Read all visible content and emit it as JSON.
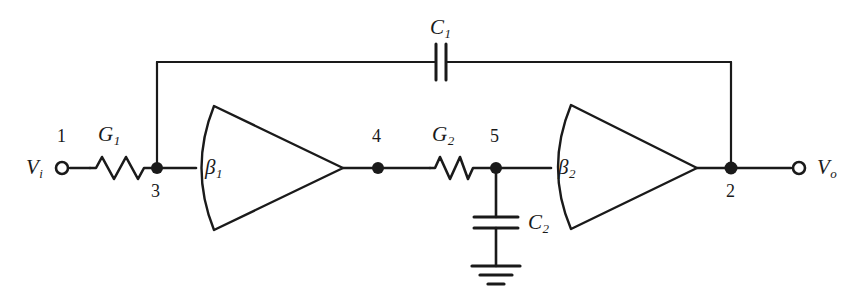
{
  "diagram": {
    "type": "circuit-schematic",
    "stroke_color": "#1a1a1a",
    "background_color": "#ffffff"
  },
  "terminals": [
    {
      "id": "vi",
      "label": "V",
      "sub": "i",
      "node_number": "1",
      "x": 62,
      "y": 168
    },
    {
      "id": "vo",
      "label": "V",
      "sub": "o",
      "node_number": "",
      "x": 799,
      "y": 168
    }
  ],
  "labels": {
    "input_voltage": "V",
    "input_voltage_sub": "i",
    "output_voltage": "V",
    "output_voltage_sub": "o",
    "resistor1": "G",
    "resistor1_sub": "1",
    "resistor2": "G",
    "resistor2_sub": "2",
    "capacitor1": "C",
    "capacitor1_sub": "1",
    "capacitor2": "C",
    "capacitor2_sub": "2",
    "amplifier1": "β",
    "amplifier1_sub": "1",
    "amplifier2": "β",
    "amplifier2_sub": "2"
  },
  "nodes": [
    {
      "number": "1",
      "x": 62,
      "y": 168,
      "kind": "terminal"
    },
    {
      "number": "3",
      "x": 157,
      "y": 168,
      "kind": "junction"
    },
    {
      "number": "4",
      "x": 378,
      "y": 168,
      "kind": "junction"
    },
    {
      "number": "5",
      "x": 496,
      "y": 168,
      "kind": "junction"
    },
    {
      "number": "2",
      "x": 731,
      "y": 168,
      "kind": "junction"
    }
  ],
  "components": [
    {
      "id": "G1",
      "type": "resistor",
      "label": "G",
      "sub": "1",
      "between": [
        "1",
        "3"
      ],
      "orientation": "horizontal"
    },
    {
      "id": "G2",
      "type": "resistor",
      "label": "G",
      "sub": "2",
      "between": [
        "4",
        "5"
      ],
      "orientation": "horizontal"
    },
    {
      "id": "C1",
      "type": "capacitor",
      "label": "C",
      "sub": "1",
      "between": [
        "3",
        "2"
      ],
      "orientation": "vertical-plates",
      "path": "top-feedback"
    },
    {
      "id": "C2",
      "type": "capacitor",
      "label": "C",
      "sub": "2",
      "between": [
        "5",
        "ground"
      ],
      "orientation": "horizontal-plates"
    },
    {
      "id": "beta1",
      "type": "amplifier",
      "label": "β",
      "sub": "1",
      "input_node": "3",
      "output_node": "4"
    },
    {
      "id": "beta2",
      "type": "amplifier",
      "label": "β",
      "sub": "2",
      "input_node": "5",
      "output_node": "2"
    },
    {
      "id": "GND",
      "type": "ground",
      "at_node": "ground"
    }
  ]
}
